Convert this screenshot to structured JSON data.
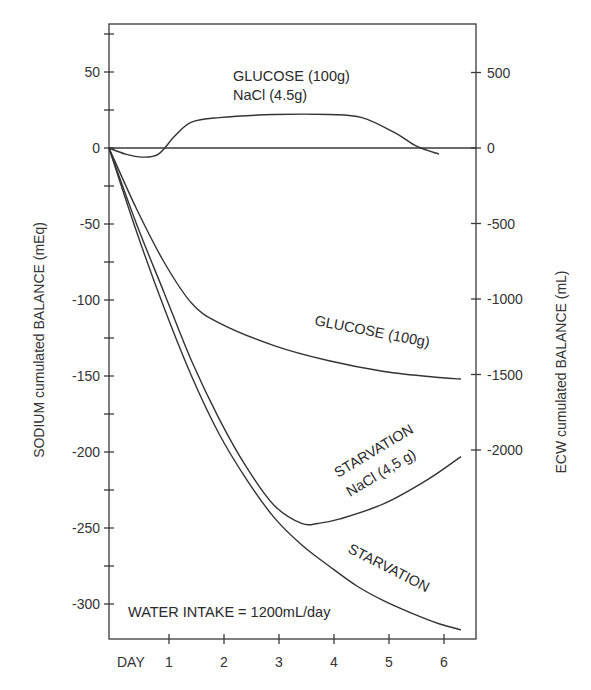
{
  "chart_data": {
    "type": "line",
    "title": "",
    "xlabel": "DAY",
    "ylabel": "SODIUM cumulated BALANCE (mEq)",
    "y2label": "ECW cumulated BALANCE  (mL)",
    "x_ticks": [
      "1",
      "2",
      "3",
      "4",
      "5",
      "6"
    ],
    "xlim": [
      0,
      6.6
    ],
    "ylim": [
      -322,
      80
    ],
    "y_ticks": [
      "50",
      "0",
      "-50",
      "-100",
      "-150",
      "-200",
      "-250",
      "-300"
    ],
    "y2_ticks": [
      "500",
      "0",
      "-500",
      "-1000",
      "-1500",
      "-2000"
    ],
    "grid": false,
    "annotation": "WATER INTAKE = 1200mL/day",
    "series": [
      {
        "name": "GLUCOSE (100g) NaCl (4.5g)",
        "label_line1": "GLUCOSE (100g)",
        "label_line2": "NaCl (4.5g)",
        "x": [
          0,
          0.3,
          0.6,
          0.9,
          1.2,
          1.5,
          2,
          3,
          4,
          4.6,
          5.2,
          5.6,
          6
        ],
        "y": [
          0,
          -4,
          -6,
          -4,
          8,
          17,
          20,
          22,
          22,
          20,
          10,
          1,
          -4
        ]
      },
      {
        "name": "GLUCOSE (100g)",
        "label": "GLUCOSE (100g)",
        "x": [
          0,
          0.5,
          1,
          1.5,
          2,
          3,
          4,
          5,
          6,
          6.4
        ],
        "y": [
          0,
          -40,
          -75,
          -102,
          -115,
          -130,
          -140,
          -147,
          -151,
          -152
        ]
      },
      {
        "name": "STARVATION NaCl (4,5 g)",
        "label_line1": "STARVATION",
        "label_line2": "NaCl (4,5 g)",
        "x": [
          0,
          0.5,
          1,
          1.5,
          2,
          2.5,
          3,
          3.5,
          3.8,
          4.2,
          5,
          5.8,
          6.4
        ],
        "y": [
          0,
          -50,
          -95,
          -140,
          -178,
          -210,
          -235,
          -247,
          -247,
          -244,
          -234,
          -218,
          -203
        ]
      },
      {
        "name": "STARVATION",
        "label": "STARVATION",
        "x": [
          0,
          0.5,
          1,
          1.5,
          2,
          2.5,
          3,
          3.5,
          4,
          4.5,
          5,
          5.5,
          6,
          6.4
        ],
        "y": [
          0,
          -55,
          -105,
          -150,
          -188,
          -218,
          -243,
          -261,
          -275,
          -288,
          -298,
          -306,
          -313,
          -317
        ]
      }
    ]
  }
}
